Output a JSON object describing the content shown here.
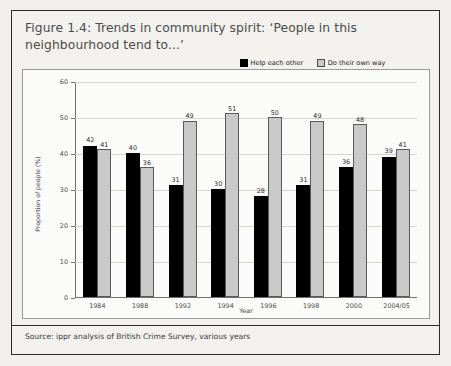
{
  "figure": {
    "title": "Figure 1.4: Trends in community spirit: ‘People in this neighbourhood tend to...’",
    "source": "Source: ippr analysis of British Crime Survey, various years"
  },
  "colors": {
    "series_help": "#000000",
    "series_own_way": "#c9c9c9",
    "panel_background": "#f2f1ee",
    "plot_background": "#fbfbfa",
    "border": "#2b2b2b",
    "gridline": "#d3d3d0",
    "axis": "#6f6f6f",
    "title_text": "#4c4c4c"
  },
  "chart_data": {
    "type": "bar",
    "title": "Figure 1.4: Trends in community spirit: ‘People in this neighbourhood tend to...’",
    "xlabel": "Year",
    "ylabel": "Proportion of people (%)",
    "ylim": [
      0,
      60
    ],
    "ytick_step": 10,
    "yticks": [
      0,
      10,
      20,
      30,
      40,
      50,
      60
    ],
    "ytick_labels": [
      "0",
      "10",
      "20",
      "30",
      "40",
      "50",
      "60"
    ],
    "grid": true,
    "grid_axis": "y",
    "legend_position": "top-right",
    "bar_labels": true,
    "categories": [
      "1984",
      "1988",
      "1992",
      "1994",
      "1996",
      "1998",
      "2000",
      "2004/05"
    ],
    "series": [
      {
        "name": "Help each other",
        "color": "#000000",
        "values": [
          42,
          40,
          31,
          30,
          28,
          31,
          36,
          39
        ]
      },
      {
        "name": "Do their own way",
        "color": "#c9c9c9",
        "values": [
          41,
          36,
          49,
          51,
          50,
          49,
          48,
          41
        ]
      }
    ]
  }
}
